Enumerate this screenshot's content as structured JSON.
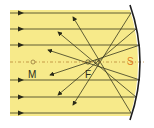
{
  "diagram": {
    "labels": {
      "center": "M",
      "focus": "F",
      "vertex": "S"
    },
    "colors": {
      "background": "#f7ea8a",
      "ray": "#3a3a20",
      "mirror": "#1e1e1e",
      "axis": "#b07a2a",
      "vertex_label": "#e07a20"
    }
  }
}
